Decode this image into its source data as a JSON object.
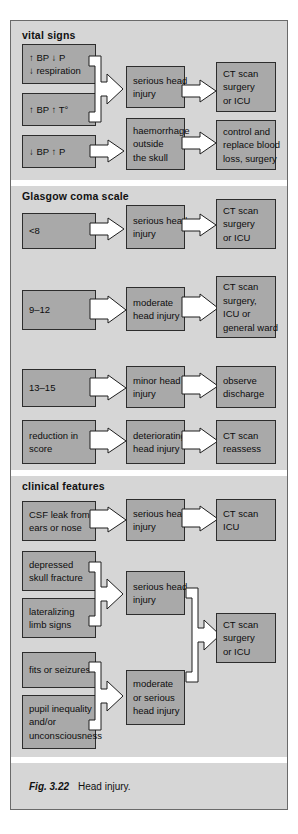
{
  "figure": {
    "number": "Fig. 3.22",
    "caption": "Head injury."
  },
  "colors": {
    "frame_background": "#d6d6d6",
    "box_fill": "#a9a9a9",
    "box_border": "#2d2d2d",
    "arrow_fill": "#ffffff",
    "arrow_border": "#1d1d1d",
    "page_background": "#ffffff",
    "text": "#0d0d0d"
  },
  "panels": [
    {
      "id": "vital-signs",
      "title": "vital signs",
      "boxes": {
        "trigger_1": [
          "↑ BP ↓ P",
          "↓ respiration"
        ],
        "trigger_2": [
          "↑ BP ↑ T°"
        ],
        "trigger_3": [
          "↓ BP ↑ P"
        ],
        "assessment_1": [
          "serious head",
          "injury"
        ],
        "assessment_2": [
          "haemorrhage",
          "outside",
          "the skull"
        ],
        "action_1": [
          "CT scan",
          "surgery",
          "or ICU"
        ],
        "action_2": [
          "control and",
          "replace blood",
          "loss, surgery"
        ]
      }
    },
    {
      "id": "glasgow-coma-scale",
      "title": "Glasgow coma scale",
      "boxes": {
        "score_1": [
          "<8"
        ],
        "score_2": [
          "9–12"
        ],
        "score_3": [
          "13–15"
        ],
        "score_4": [
          "reduction in",
          "score"
        ],
        "assessment_1": [
          "serious head",
          "injury"
        ],
        "assessment_2": [
          "moderate",
          "head injury"
        ],
        "assessment_3": [
          "minor head",
          "injury"
        ],
        "assessment_4": [
          "deteriorating",
          "head injury"
        ],
        "action_1": [
          "CT scan",
          "surgery",
          "or ICU"
        ],
        "action_2": [
          "CT scan",
          "surgery,",
          "ICU or",
          "general ward"
        ],
        "action_3": [
          "observe",
          "discharge"
        ],
        "action_4": [
          "CT scan",
          "reassess"
        ]
      }
    },
    {
      "id": "clinical-features",
      "title": "clinical features",
      "boxes": {
        "feature_1": [
          "CSF leak from",
          "ears or nose"
        ],
        "feature_2": [
          "depressed",
          "skull fracture"
        ],
        "feature_3": [
          "lateralizing",
          "limb signs"
        ],
        "feature_4": [
          "fits or seizures"
        ],
        "feature_5": [
          "pupil inequality",
          "and/or",
          "unconsciousness"
        ],
        "assessment_1": [
          "serious head",
          "injury"
        ],
        "assessment_2": [
          "serious head",
          "injury"
        ],
        "assessment_3": [
          "moderate",
          "or serious",
          "head injury"
        ],
        "action_1": [
          "CT scan",
          "ICU"
        ],
        "action_2": [
          "CT scan",
          "surgery",
          "or ICU"
        ]
      }
    }
  ]
}
